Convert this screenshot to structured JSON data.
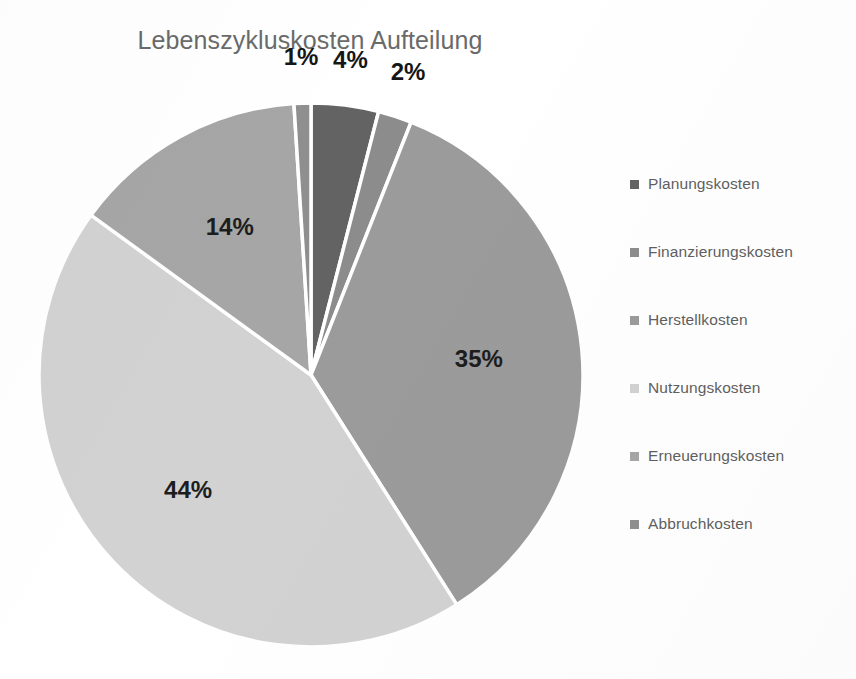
{
  "chart_data": {
    "type": "pie",
    "title": "Lebenszykluskosten Aufteilung",
    "categories": [
      "Planungskosten",
      "Finanzierungskosten",
      "Herstellkosten",
      "Nutzungskosten",
      "Erneuerungskosten",
      "Abbruchkosten"
    ],
    "values": [
      4,
      2,
      35,
      44,
      14,
      1
    ],
    "value_unit": "%",
    "data_labels": [
      "4%",
      "2%",
      "35%",
      "44%",
      "14%",
      "1%"
    ],
    "start_angle_deg": 0,
    "direction": "clockwise",
    "legend_position": "right",
    "grid": false,
    "slice_colors": [
      "#636363",
      "#8c8c8c",
      "#9b9b9b",
      "#d2d2d2",
      "#a6a6a6",
      "#8f8f8f"
    ],
    "slice_border_color": "#ffffff",
    "background_color": "#ffffff",
    "title_color": "#6a6a6a",
    "label_color": "#1d1d1d",
    "legend_text_color": "#5f5f5f",
    "slices": [
      {
        "label": "Planungskosten",
        "value": 4,
        "display": "4%",
        "color": "#636363"
      },
      {
        "label": "Finanzierungskosten",
        "value": 2,
        "display": "2%",
        "color": "#8c8c8c"
      },
      {
        "label": "Herstellkosten",
        "value": 35,
        "display": "35%",
        "color": "#9b9b9b"
      },
      {
        "label": "Nutzungskosten",
        "value": 44,
        "display": "44%",
        "color": "#d2d2d2"
      },
      {
        "label": "Erneuerungskosten",
        "value": 14,
        "display": "14%",
        "color": "#a6a6a6"
      },
      {
        "label": "Abbruchkosten",
        "value": 1,
        "display": "1%",
        "color": "#8f8f8f"
      }
    ]
  },
  "legend": {
    "items": [
      {
        "label": "Planungskosten",
        "color": "#636363"
      },
      {
        "label": "Finanzierungskosten",
        "color": "#8c8c8c"
      },
      {
        "label": "Herstellkosten",
        "color": "#9b9b9b"
      },
      {
        "label": "Nutzungskosten",
        "color": "#d2d2d2"
      },
      {
        "label": "Erneuerungskosten",
        "color": "#a6a6a6"
      },
      {
        "label": "Abbruchkosten",
        "color": "#8f8f8f"
      }
    ]
  }
}
